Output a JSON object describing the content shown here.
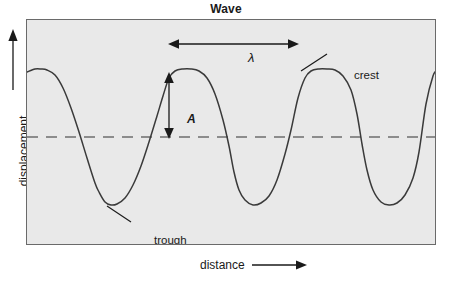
{
  "figure": {
    "title": "Wave",
    "background_color": "#ffffff",
    "plot_background_color": "#e9e9e9",
    "plot_border_color": "#6a6a6a",
    "curve_color": "#3a3a3a",
    "axis_line_color": "#1a1a1a",
    "centerline_color": "#6e6e6e"
  },
  "axes": {
    "y_label": "displacement",
    "x_label": "distance",
    "y_arrow_icon": "arrow-up-icon",
    "x_arrow_icon": "arrow-right-icon"
  },
  "annotations": {
    "wavelength_symbol": "λ",
    "wavelength_arrow_icon": "double-headed-arrow-horizontal-icon",
    "amplitude_symbol": "A",
    "amplitude_arrow_icon": "double-headed-arrow-vertical-icon",
    "crest_label": "crest",
    "crest_leader_icon": "leader-line-icon",
    "trough_label": "trough",
    "trough_leader_icon": "leader-line-icon",
    "centerline_icon": "dashed-equilibrium-line-icon"
  },
  "chart_data": {
    "type": "line",
    "title": "Wave",
    "xlabel": "distance",
    "ylabel": "displacement",
    "grid": false,
    "legend": null,
    "xlim": [
      0,
      410
    ],
    "ylim": [
      0,
      226
    ],
    "equilibrium_y": 117,
    "amplitude_px": 49,
    "wavelength_px": 128,
    "crest_y": 49,
    "trough_y": 185,
    "crest_x_positions": [
      14,
      142,
      271,
      399
    ],
    "trough_x_positions": [
      78,
      207,
      335
    ],
    "series": [
      {
        "name": "wave",
        "x": [
          0,
          8,
          14,
          20,
          28,
          36,
          44,
          52,
          60,
          68,
          72,
          78,
          84,
          90,
          98,
          106,
          114,
          122,
          130,
          136,
          142,
          148,
          156,
          164,
          172,
          180,
          188,
          196,
          202,
          207,
          212,
          218,
          226,
          234,
          242,
          250,
          258,
          264,
          271,
          278,
          284,
          292,
          300,
          308,
          316,
          324,
          330,
          335,
          340,
          346,
          354,
          362,
          370,
          378,
          386,
          392,
          399,
          406,
          410
        ],
        "y": [
          52,
          49,
          49,
          50,
          55,
          68,
          88,
          112,
          138,
          163,
          172,
          182,
          185,
          184,
          178,
          165,
          146,
          122,
          96,
          76,
          58,
          51,
          49,
          49,
          51,
          58,
          74,
          100,
          126,
          152,
          170,
          180,
          185,
          183,
          176,
          160,
          134,
          110,
          78,
          58,
          51,
          49,
          49,
          50,
          56,
          70,
          94,
          124,
          150,
          170,
          182,
          185,
          183,
          175,
          158,
          132,
          84,
          56,
          50
        ]
      }
    ]
  }
}
